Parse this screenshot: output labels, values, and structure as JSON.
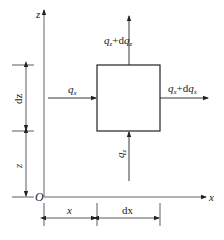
{
  "diagram": {
    "axes": {
      "z_label": "z",
      "x_label": "x",
      "origin_label": "O"
    },
    "element_box": {
      "label": "control element"
    },
    "fluxes": {
      "qx_in": {
        "base": "q",
        "sub": "x"
      },
      "qx_out": {
        "base": "q",
        "sub": "x",
        "plus": "+d",
        "base2": "q",
        "sub2": "x"
      },
      "qz_in": {
        "base": "q",
        "sub": "z"
      },
      "qz_out": {
        "base": "q",
        "sub": "z",
        "plus": "+d",
        "base2": "q",
        "sub2": "z"
      }
    },
    "dimensions": {
      "x": "x",
      "dx": "dx",
      "z": "z",
      "dz": "dz"
    },
    "colors": {
      "line": "#222222",
      "axis": "#555555",
      "background": "#ffffff"
    }
  }
}
